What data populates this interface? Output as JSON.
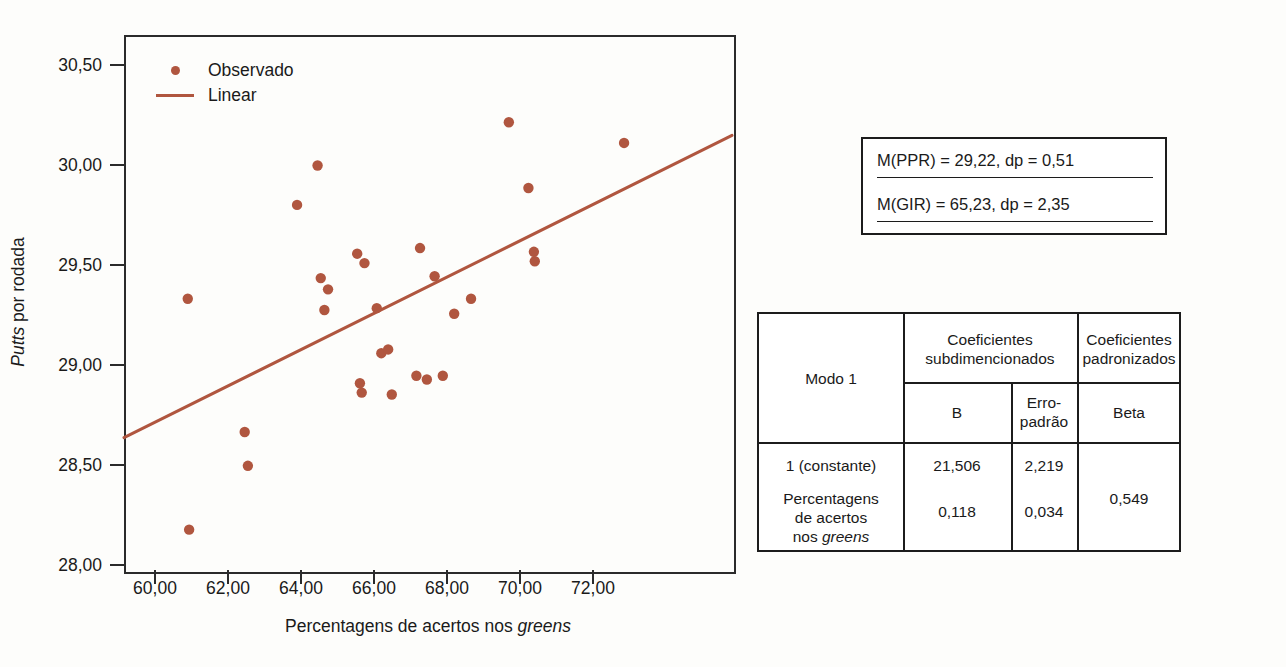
{
  "chart_data": {
    "type": "scatter",
    "title": "",
    "xlabel": "Percentagens de acertos nos greens",
    "ylabel": "Putts por rodada",
    "ylabel_italic_prefix": "Putts",
    "ylabel_rest": " por rodada",
    "xlabel_plain": "Percentagens de acertos nos ",
    "xlabel_italic": "greens",
    "xlim": [
      59.3,
      72.65
    ],
    "ylim": [
      27.825,
      30.675
    ],
    "xticks": [
      "60,00",
      "62,00",
      "64,00",
      "66,00",
      "68,00",
      "70,00",
      "72,00"
    ],
    "xtick_values": [
      60,
      62,
      64,
      66,
      68,
      70,
      72
    ],
    "yticks": [
      "30,50",
      "30,00",
      "29,50",
      "29,00",
      "28,50",
      "28,00"
    ],
    "ytick_values": [
      30.5,
      30.0,
      29.5,
      29.0,
      28.5,
      28.0
    ],
    "grid": false,
    "legend_position": "top-left",
    "legend": [
      {
        "label": "Observado",
        "marker": "dot",
        "color": "#b0563f"
      },
      {
        "label": "Linear",
        "marker": "line",
        "color": "#b0563f"
      }
    ],
    "series": [
      {
        "name": "Observado",
        "color": "#b0563f",
        "points": [
          [
            60.73,
            28.04
          ],
          [
            60.7,
            29.27
          ],
          [
            61.95,
            28.56
          ],
          [
            62.02,
            28.38
          ],
          [
            63.1,
            29.77
          ],
          [
            63.55,
            29.98
          ],
          [
            63.62,
            29.38
          ],
          [
            63.78,
            29.32
          ],
          [
            63.7,
            29.21
          ],
          [
            64.42,
            29.51
          ],
          [
            64.58,
            29.46
          ],
          [
            64.48,
            28.82
          ],
          [
            64.52,
            28.77
          ],
          [
            64.85,
            29.22
          ],
          [
            64.95,
            28.98
          ],
          [
            65.1,
            29.0
          ],
          [
            65.18,
            28.76
          ],
          [
            65.72,
            28.86
          ],
          [
            65.8,
            29.54
          ],
          [
            65.95,
            28.84
          ],
          [
            66.12,
            29.39
          ],
          [
            66.3,
            28.86
          ],
          [
            66.55,
            29.19
          ],
          [
            66.92,
            29.27
          ],
          [
            67.75,
            30.21
          ],
          [
            68.18,
            29.86
          ],
          [
            68.3,
            29.52
          ],
          [
            68.32,
            29.47
          ],
          [
            70.28,
            30.1
          ]
        ]
      }
    ],
    "trendline": {
      "name": "Linear",
      "color": "#b0563f",
      "type": "linear",
      "x_start": 59.3,
      "y_start": 28.53,
      "x_end": 72.65,
      "y_end": 30.14
    }
  },
  "stats_box": {
    "line1": "M(PPR) = 29,22, dp = 0,51",
    "line2": "M(GIR) = 65,23, dp = 2,35"
  },
  "coef_table": {
    "model_label": "Modo 1",
    "group_headers": [
      "Coeficientes subdimencionados",
      "Coeficientes padronizados"
    ],
    "group_header_1_l1": "Coeficientes",
    "group_header_1_l2": "subdimencionados",
    "group_header_2_l1": "Coeficientes",
    "group_header_2_l2": "padronizados",
    "sub_headers": [
      "B",
      "Erro-padrão",
      "Beta"
    ],
    "rows": [
      {
        "label": "1 (constante)",
        "label_lines": [
          "1 (constante)"
        ],
        "B": "21,506",
        "erro_padrao": "2,219",
        "beta": ""
      },
      {
        "label": "Percentagens de acertos nos greens",
        "label_lines": [
          "Percentagens",
          "de acertos",
          "nos "
        ],
        "label_italic": "greens",
        "B": "0,118",
        "erro_padrao": "0,034",
        "beta": "0,549"
      }
    ],
    "beta_merged": "0,549"
  },
  "bleed_text": {
    "col_right_lines": [
      "dalidade. Desse modo, conclui-se que há, de",
      "fato, uma correlação entre a quantidade de",
      "Índices que a podem existir de distâncias",
      "constante aplicação ao ao longo do per-",
      "curso. No entanto, é importante ressaltar",
      "curso do jogo. Isso equivale a dizer que não",
      "monstra-se a correlação existe, alguma",
      "do golfe. Esse um impacto direto fora do",
      "tida, e toda a ordem de aferição da dis-",
      "final, pois não, as que o atleta realiza",
      "a distância a ser percorrida pela bola até o",
      "buraco, o que pode ser medido em metros.",
      "Ainda, para o caso da correlação entre",
      "as duas variáveis de um lado, analisando-se",
      "dos valores obtidos. Em segundo lugar, os",
      "na tabela anterior, a seguir demonstram-se",
      "que há na outra condição, entre o banho de",
      "meta. Isso é o pressuposto de as pessoas",
      "quando olham a variável, enquanto que os",
      "valores de uma ação, a taxa de cada valor",
      "final, podem ser encontrados múltiplos pontos"
    ],
    "right_margin_note": "0000"
  }
}
